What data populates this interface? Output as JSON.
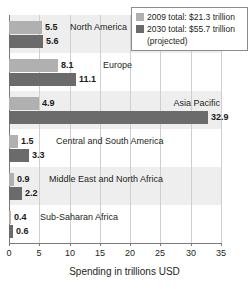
{
  "top_clipped_text": "",
  "chart_data": {
    "type": "bar",
    "orientation": "horizontal",
    "title": "",
    "xlabel": "Spending in trillions USD",
    "ylabel": "",
    "xlim": [
      0,
      35
    ],
    "xticks": [
      0,
      5,
      10,
      15,
      20,
      25,
      30,
      35
    ],
    "xtick_labels": [
      "0",
      "5",
      "10",
      "15",
      "20",
      "25",
      "30",
      "35"
    ],
    "grid": true,
    "legend_position": "top-right",
    "categories": [
      "North America",
      "Europe",
      "Asia Pacific",
      "Central and South America",
      "Middle East and North Africa",
      "Sub-Saharan Africa"
    ],
    "series": [
      {
        "name": "2009 total: $21.3 trillion",
        "short_name": "2009",
        "color": "#b0b0b0",
        "values": [
          5.5,
          8.1,
          4.9,
          1.5,
          0.9,
          0.4
        ],
        "value_labels": [
          "5.5",
          "8.1",
          "4.9",
          "1.5",
          "0.9",
          "0.4"
        ]
      },
      {
        "name": "2030 total: $55.7 trillion",
        "short_name": "2030",
        "name_line2": "(projected)",
        "color": "#6b6b6b",
        "values": [
          5.6,
          11.1,
          32.9,
          3.3,
          2.2,
          0.6
        ],
        "value_labels": [
          "5.6",
          "11.1",
          "32.9",
          "3.3",
          "2.2",
          "0.6"
        ]
      }
    ]
  },
  "legend": {
    "items": [
      {
        "label": "2009 total: $21.3 trillion",
        "sub": "",
        "color": "#b0b0b0",
        "swatch_name": "legend-swatch-2009"
      },
      {
        "label": "2030 total: $55.7 trillion",
        "sub": "(projected)",
        "color": "#6b6b6b",
        "swatch_name": "legend-swatch-2030"
      }
    ]
  },
  "axis": {
    "title": "Spending in trillions USD"
  },
  "colors": {
    "series_2009": "#b0b0b0",
    "series_2030": "#6b6b6b",
    "row_band": "#efeeee",
    "gridline": "#cfcfcf",
    "axis": "#7a7a7a",
    "text": "#231f20",
    "background": "#ffffff"
  }
}
